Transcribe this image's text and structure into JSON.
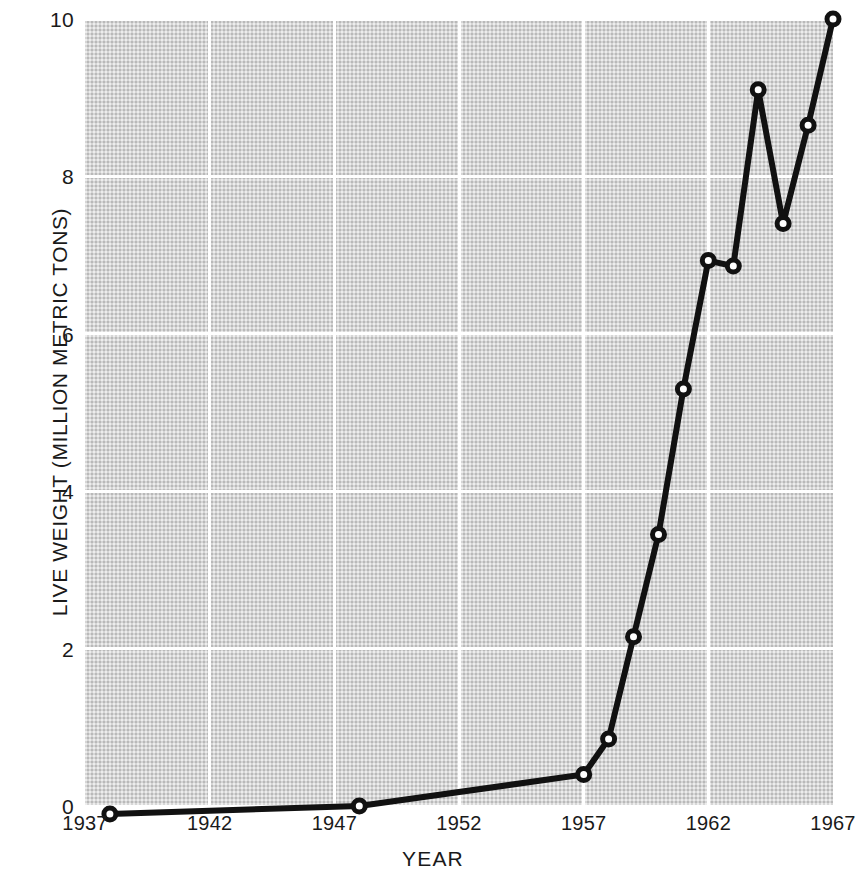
{
  "chart_data": {
    "type": "line",
    "title": "",
    "xlabel": "YEAR",
    "ylabel": "LIVE WEIGHT (MILLION METRIC TONS)",
    "xlim": [
      1937,
      1967
    ],
    "ylim": [
      0,
      10
    ],
    "xticks": [
      1937,
      1942,
      1947,
      1952,
      1957,
      1962,
      1967
    ],
    "xtick_labels": [
      "1937",
      "1942",
      "1947",
      "1952",
      "1957",
      "1962",
      "1967"
    ],
    "yticks": [
      0,
      2,
      4,
      6,
      8,
      10
    ],
    "ytick_labels": [
      "0",
      "2",
      "4",
      "6",
      "8",
      "10"
    ],
    "grid": true,
    "legend": "none",
    "marker": "open-circle",
    "line_color": "#111111",
    "marker_fill": "#ffffff",
    "plot_background": "#d6d6d6",
    "gridline_color": "#ffffff",
    "series": [
      {
        "name": "Live weight",
        "x": [
          1938,
          1948,
          1957,
          1958,
          1959,
          1960,
          1961,
          1962,
          1963,
          1964,
          1965,
          1966,
          1967
        ],
        "values": [
          -0.1,
          0.0,
          0.4,
          0.85,
          2.15,
          3.45,
          5.3,
          6.93,
          6.86,
          9.1,
          7.4,
          8.65,
          10.0
        ]
      }
    ]
  },
  "axes": {
    "x_title": "YEAR",
    "y_title": "LIVE WEIGHT (MILLION METRIC TONS)"
  }
}
